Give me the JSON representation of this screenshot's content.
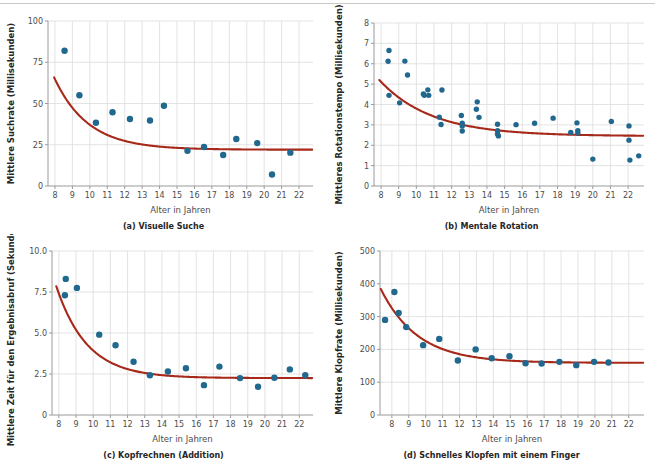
{
  "figure": {
    "background": "#ffffff",
    "point_color": "#21688f",
    "line_color": "#a6291a",
    "grid_color": "#dcdcdc",
    "axis_color": "#9a9a9a",
    "shared_xlabel": "Alter in Jahren"
  },
  "chart_data": [
    {
      "id": "a",
      "type": "scatter",
      "title": "(a) Visuelle Suche",
      "caption": "(a) Visuelle Suche",
      "xlabel": "Alter in Jahren",
      "ylabel": "Mittlere Suchrate (Millisekunden)",
      "xlim": [
        7.6,
        22.8
      ],
      "ylim": [
        0,
        100
      ],
      "xticks": [
        8,
        9,
        10,
        11,
        12,
        13,
        14,
        15,
        16,
        17,
        18,
        19,
        20,
        21,
        22
      ],
      "xticklabels": [
        "8",
        "9",
        "10",
        "11",
        "12",
        "13",
        "14",
        "15",
        "16",
        "17",
        "18",
        "19",
        "20",
        "21",
        "22"
      ],
      "yticks": [
        0,
        25,
        50,
        75,
        100
      ],
      "yticklabels": [
        "0",
        "25",
        "50",
        "75",
        "100"
      ],
      "grid": true,
      "legend": "none",
      "points": [
        [
          8.55,
          82.0
        ],
        [
          9.4,
          55.0
        ],
        [
          10.35,
          38.3
        ],
        [
          11.3,
          44.7
        ],
        [
          12.3,
          40.6
        ],
        [
          13.45,
          39.7
        ],
        [
          14.25,
          48.6
        ],
        [
          15.6,
          21.3
        ],
        [
          16.55,
          23.6
        ],
        [
          17.65,
          18.8
        ],
        [
          18.4,
          28.5
        ],
        [
          19.6,
          26.0
        ],
        [
          20.45,
          7.0
        ],
        [
          21.5,
          20.2
        ]
      ],
      "fit": {
        "form": "exponential-decay",
        "asymptote": 22.0,
        "amplitude": 45.0,
        "rate": 0.52,
        "x0": 7.9,
        "x_start": 7.95,
        "x_end": 22.75
      }
    },
    {
      "id": "b",
      "type": "scatter",
      "title": "(b) Mentale Rotation",
      "caption": "(b) Mentale Rotation",
      "xlabel": "Alter in Jahren",
      "ylabel": "Mittleres Rotationstempo (Millisekunden)",
      "xlim": [
        7.6,
        22.9
      ],
      "ylim": [
        0,
        8
      ],
      "xticks": [
        8,
        9,
        10,
        11,
        12,
        13,
        14,
        15,
        16,
        17,
        18,
        19,
        20,
        21,
        22
      ],
      "xticklabels": [
        "8",
        "9",
        "10",
        "11",
        "12",
        "13",
        "14",
        "15",
        "16",
        "17",
        "18",
        "19",
        "20",
        "21",
        "22"
      ],
      "yticks": [
        0,
        1,
        2,
        3,
        4,
        5,
        6,
        7,
        8
      ],
      "yticklabels": [
        "0",
        "1",
        "2",
        "3",
        "4",
        "5",
        "6",
        "7",
        "8"
      ],
      "grid": true,
      "legend": "none",
      "points": [
        [
          8.45,
          6.65
        ],
        [
          8.4,
          6.12
        ],
        [
          9.35,
          6.13
        ],
        [
          9.5,
          5.45
        ],
        [
          8.45,
          4.45
        ],
        [
          9.05,
          4.08
        ],
        [
          10.4,
          4.52
        ],
        [
          10.45,
          4.45
        ],
        [
          10.65,
          4.72
        ],
        [
          10.7,
          4.45
        ],
        [
          11.45,
          4.71
        ],
        [
          11.4,
          3.02
        ],
        [
          11.3,
          3.38
        ],
        [
          12.55,
          3.46
        ],
        [
          12.6,
          3.08
        ],
        [
          12.6,
          2.95
        ],
        [
          12.6,
          2.7
        ],
        [
          13.45,
          4.13
        ],
        [
          13.4,
          3.77
        ],
        [
          13.55,
          3.37
        ],
        [
          14.6,
          3.03
        ],
        [
          14.6,
          2.72
        ],
        [
          14.6,
          2.55
        ],
        [
          14.65,
          2.46
        ],
        [
          15.65,
          3.01
        ],
        [
          16.7,
          3.08
        ],
        [
          17.75,
          3.33
        ],
        [
          18.75,
          2.63
        ],
        [
          19.1,
          3.1
        ],
        [
          19.15,
          2.72
        ],
        [
          19.15,
          2.6
        ],
        [
          20.0,
          1.32
        ],
        [
          21.05,
          3.17
        ],
        [
          22.05,
          2.95
        ],
        [
          22.05,
          2.25
        ],
        [
          22.1,
          1.27
        ],
        [
          22.6,
          1.48
        ]
      ],
      "fit": {
        "form": "exponential-decay",
        "asymptote": 2.45,
        "amplitude": 2.8,
        "rate": 0.34,
        "x0": 7.85,
        "x_start": 7.9,
        "x_end": 22.85
      }
    },
    {
      "id": "c",
      "type": "scatter",
      "title": "(c) Kopfrechnen (Addition)",
      "caption": "(c) Kopfrechnen (Addition)",
      "xlabel": "Alter in Jahren",
      "ylabel": "Mittlere Zeit für den Ergebnisabruf (Sekunden)",
      "xlim": [
        7.6,
        22.8
      ],
      "ylim": [
        0,
        10
      ],
      "xticks": [
        8,
        9,
        10,
        11,
        12,
        13,
        14,
        15,
        16,
        17,
        18,
        19,
        20,
        21,
        22
      ],
      "xticklabels": [
        "8",
        "9",
        "10",
        "11",
        "12",
        "13",
        "14",
        "15",
        "16",
        "17",
        "18",
        "19",
        "20",
        "21",
        "22"
      ],
      "yticks": [
        0,
        2.5,
        5.0,
        7.5,
        10.0
      ],
      "yticklabels": [
        "0",
        "2.5",
        "5.0",
        "7.5",
        "10.0"
      ],
      "grid": true,
      "legend": "none",
      "points": [
        [
          8.4,
          8.3
        ],
        [
          8.35,
          7.3
        ],
        [
          9.05,
          7.75
        ],
        [
          10.35,
          4.9
        ],
        [
          11.3,
          4.25
        ],
        [
          12.35,
          3.25
        ],
        [
          13.3,
          2.42
        ],
        [
          14.35,
          2.65
        ],
        [
          15.4,
          2.85
        ],
        [
          16.45,
          1.82
        ],
        [
          17.35,
          2.95
        ],
        [
          18.55,
          2.25
        ],
        [
          19.6,
          1.72
        ],
        [
          20.55,
          2.27
        ],
        [
          21.45,
          2.78
        ],
        [
          22.35,
          2.42
        ]
      ],
      "fit": {
        "form": "exponential-decay",
        "asymptote": 2.25,
        "amplitude": 5.6,
        "rate": 0.56,
        "x0": 7.85,
        "x_start": 7.85,
        "x_end": 22.75
      }
    },
    {
      "id": "d",
      "type": "scatter",
      "title": "(d) Schnelles Klopfen mit einem Finger",
      "caption": "(d) Schnelles Klopfen mit einem Finger",
      "xlabel": "Alter in Jahren",
      "ylabel": "Mittlere Klopfrate (Millisekunden)",
      "xlim": [
        7.3,
        22.9
      ],
      "ylim": [
        0,
        500
      ],
      "xticks": [
        8,
        9,
        10,
        11,
        12,
        13,
        14,
        15,
        16,
        17,
        18,
        19,
        20,
        21,
        22
      ],
      "xticklabels": [
        "8",
        "9",
        "10",
        "11",
        "12",
        "13",
        "14",
        "15",
        "16",
        "17",
        "18",
        "19",
        "20",
        "21",
        "22"
      ],
      "yticks": [
        0,
        100,
        200,
        300,
        400,
        500
      ],
      "yticklabels": [
        "0",
        "100",
        "200",
        "300",
        "400",
        "500"
      ],
      "grid": true,
      "legend": "none",
      "points": [
        [
          7.6,
          290
        ],
        [
          8.15,
          375
        ],
        [
          8.4,
          311
        ],
        [
          8.85,
          268
        ],
        [
          9.85,
          213
        ],
        [
          10.8,
          232
        ],
        [
          11.9,
          166
        ],
        [
          12.95,
          200
        ],
        [
          13.9,
          173
        ],
        [
          14.95,
          179
        ],
        [
          15.9,
          158
        ],
        [
          16.85,
          157
        ],
        [
          17.9,
          162
        ],
        [
          18.9,
          152
        ],
        [
          19.95,
          162
        ],
        [
          20.8,
          160
        ]
      ],
      "fit": {
        "form": "exponential-decay",
        "asymptote": 159.0,
        "amplitude": 225.0,
        "rate": 0.46,
        "x0": 7.35,
        "x_start": 7.35,
        "x_end": 22.85
      }
    }
  ]
}
